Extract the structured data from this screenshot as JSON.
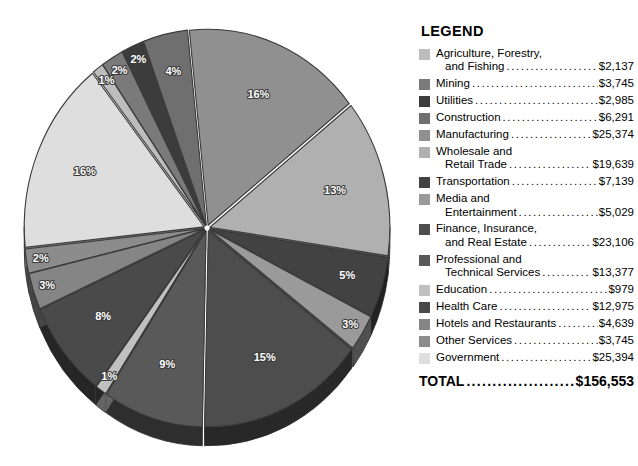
{
  "legend": {
    "title": "LEGEND",
    "total_label": "TOTAL",
    "total_value": "$156,553",
    "items": [
      {
        "label_line1": "Agriculture, Forestry,",
        "label_line2": "and Fishing",
        "value": "$2,137",
        "color": "#bdbdbd"
      },
      {
        "label_line1": "Mining",
        "label_line2": "",
        "value": "$3,745",
        "color": "#7a7a7a"
      },
      {
        "label_line1": "Utilities",
        "label_line2": "",
        "value": "$2,985",
        "color": "#3c3c3c"
      },
      {
        "label_line1": "Construction",
        "label_line2": "",
        "value": "$6,291",
        "color": "#6f6f6f"
      },
      {
        "label_line1": "Manufacturing",
        "label_line2": "",
        "value": "$25,374",
        "color": "#909090"
      },
      {
        "label_line1": "Wholesale and",
        "label_line2": "Retail Trade",
        "value": "$19,639",
        "color": "#b0b0b0"
      },
      {
        "label_line1": "Transportation",
        "label_line2": "",
        "value": "$7,139",
        "color": "#424242"
      },
      {
        "label_line1": "Media and",
        "label_line2": "Entertainment",
        "value": "$5,029",
        "color": "#9a9a9a"
      },
      {
        "label_line1": "Finance, Insurance,",
        "label_line2": "and Real Estate",
        "value": "$23,106",
        "color": "#4d4d4d"
      },
      {
        "label_line1": "Professional and",
        "label_line2": "Technical Services",
        "value": "$13,377",
        "color": "#595959"
      },
      {
        "label_line1": "Education",
        "label_line2": "",
        "value": "$979",
        "color": "#c0c0c0"
      },
      {
        "label_line1": "Health Care",
        "label_line2": "",
        "value": "$12,975",
        "color": "#4a4a4a"
      },
      {
        "label_line1": "Hotels and Restaurants",
        "label_line2": "",
        "value": "$4,639",
        "color": "#858585"
      },
      {
        "label_line1": "Other Services",
        "label_line2": "",
        "value": "$3,745",
        "color": "#8c8c8c"
      },
      {
        "label_line1": "Government",
        "label_line2": "",
        "value": "$25,394",
        "color": "#dedede"
      }
    ]
  },
  "chart_data": {
    "type": "pie",
    "title": "",
    "unit": "$ millions",
    "total": 156553,
    "legend_position": "right",
    "labels_shown": "percent",
    "categories": [
      "Agriculture, Forestry, and Fishing",
      "Mining",
      "Utilities",
      "Construction",
      "Manufacturing",
      "Wholesale and Retail Trade",
      "Transportation",
      "Media and Entertainment",
      "Finance, Insurance, and Real Estate",
      "Professional and Technical Services",
      "Education",
      "Health Care",
      "Hotels and Restaurants",
      "Other Services",
      "Government"
    ],
    "values": [
      2137,
      3745,
      2985,
      6291,
      25374,
      19639,
      7139,
      5029,
      23106,
      13377,
      979,
      12975,
      4639,
      3745,
      25394
    ],
    "percents": [
      1,
      2,
      2,
      4,
      16,
      13,
      5,
      3,
      15,
      9,
      1,
      8,
      3,
      2,
      16
    ],
    "percent_labels": [
      "1%",
      "2%",
      "2%",
      "4%",
      "16%",
      "13%",
      "5%",
      "3%",
      "15%",
      "9%",
      "1%",
      "8%",
      "3%",
      "2%",
      "16%"
    ],
    "colors": [
      "#bdbdbd",
      "#7a7a7a",
      "#3c3c3c",
      "#6f6f6f",
      "#909090",
      "#b0b0b0",
      "#424242",
      "#9a9a9a",
      "#4d4d4d",
      "#595959",
      "#c0c0c0",
      "#4a4a4a",
      "#858585",
      "#8c8c8c",
      "#dedede"
    ]
  }
}
